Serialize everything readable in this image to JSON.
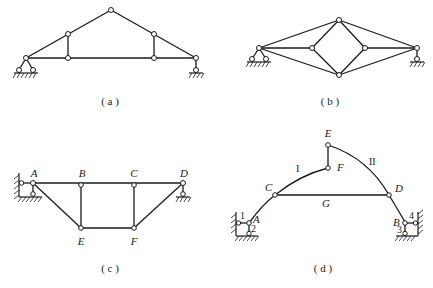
{
  "figures": {
    "a": {
      "caption": "( a )"
    },
    "b": {
      "caption": "( b )"
    },
    "c": {
      "caption": "( c )",
      "nodes": {
        "A": "A",
        "B": "B",
        "C": "C",
        "D": "D",
        "E": "E",
        "F": "F"
      }
    },
    "d": {
      "caption": "( d )",
      "nodes": {
        "A": "A",
        "B": "B",
        "C": "C",
        "D": "D",
        "E": "E",
        "F": "F",
        "G": "G"
      },
      "members": {
        "I": "I",
        "II": "II"
      },
      "links": {
        "l1": "1",
        "l2": "2",
        "l3": "3",
        "l4": "4"
      }
    }
  },
  "colors": {
    "line": "#1a1a1a",
    "background": "#ffffff"
  }
}
